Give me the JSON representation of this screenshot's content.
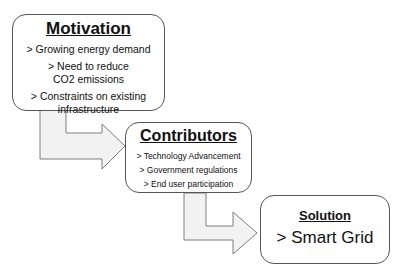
{
  "diagram": {
    "type": "flow",
    "boxes": [
      {
        "id": "motivation",
        "title": "Motivation",
        "items": [
          "> Growing energy demand",
          "> Need to reduce CO2 emissions",
          "> Constraints on existing infrastructure"
        ]
      },
      {
        "id": "contributors",
        "title": "Contributors",
        "items": [
          "> Technology Advancement",
          "> Government regulations",
          "> End user participation"
        ]
      },
      {
        "id": "solution",
        "title": "Solution",
        "items": [
          "> Smart Grid"
        ]
      }
    ],
    "arrows": [
      {
        "from": "motivation",
        "to": "contributors",
        "style": "bent-block-arrow"
      },
      {
        "from": "contributors",
        "to": "solution",
        "style": "bent-block-arrow"
      }
    ],
    "colors": {
      "arrow_fill": "#f2f2f2",
      "arrow_stroke": "#7f7f7f",
      "box_border": "#555555"
    }
  }
}
